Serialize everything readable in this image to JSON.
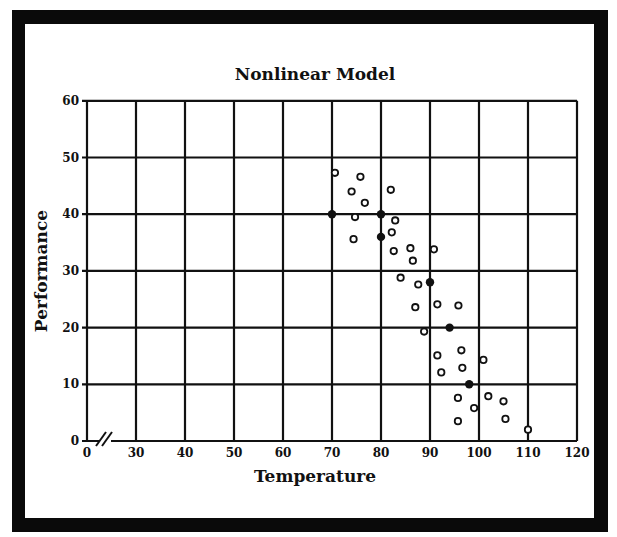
{
  "chart_data": {
    "type": "scatter",
    "title": "Nonlinear Model",
    "xlabel": "Temperature",
    "ylabel": "Performance",
    "xlim": [
      0,
      120
    ],
    "ylim": [
      0,
      60
    ],
    "x_axis_break": true,
    "x_ticks": [
      0,
      30,
      40,
      50,
      60,
      70,
      80,
      90,
      100,
      110,
      120
    ],
    "y_ticks": [
      0,
      10,
      20,
      30,
      40,
      50,
      60
    ],
    "grid": true,
    "legend": null,
    "series": [
      {
        "name": "Observed",
        "marker": "hollow-circle",
        "points": [
          [
            70.6,
            47.3
          ],
          [
            75.8,
            46.6
          ],
          [
            74.0,
            44.0
          ],
          [
            76.7,
            42.0
          ],
          [
            82.0,
            44.3
          ],
          [
            74.7,
            39.5
          ],
          [
            74.4,
            35.6
          ],
          [
            82.9,
            38.9
          ],
          [
            82.2,
            36.8
          ],
          [
            82.6,
            33.5
          ],
          [
            86.0,
            34.0
          ],
          [
            86.5,
            31.8
          ],
          [
            90.8,
            33.8
          ],
          [
            84.0,
            28.8
          ],
          [
            87.6,
            27.6
          ],
          [
            87.0,
            23.6
          ],
          [
            91.5,
            24.1
          ],
          [
            95.8,
            23.9
          ],
          [
            88.8,
            19.3
          ],
          [
            91.5,
            15.1
          ],
          [
            96.4,
            16.0
          ],
          [
            100.9,
            14.3
          ],
          [
            92.3,
            12.1
          ],
          [
            96.6,
            12.9
          ],
          [
            95.7,
            7.6
          ],
          [
            99.0,
            5.8
          ],
          [
            101.9,
            7.9
          ],
          [
            105.0,
            7.0
          ],
          [
            95.7,
            3.5
          ],
          [
            105.4,
            3.9
          ],
          [
            110.0,
            2.0
          ]
        ]
      },
      {
        "name": "Model",
        "marker": "filled-circle",
        "points": [
          [
            70,
            40
          ],
          [
            80,
            40
          ],
          [
            80,
            36
          ],
          [
            90,
            28
          ],
          [
            94,
            20
          ],
          [
            98,
            10
          ]
        ]
      }
    ]
  },
  "colors": {
    "frame": "#0a0a0a",
    "background": "#ffffff",
    "ink": "#111111"
  }
}
